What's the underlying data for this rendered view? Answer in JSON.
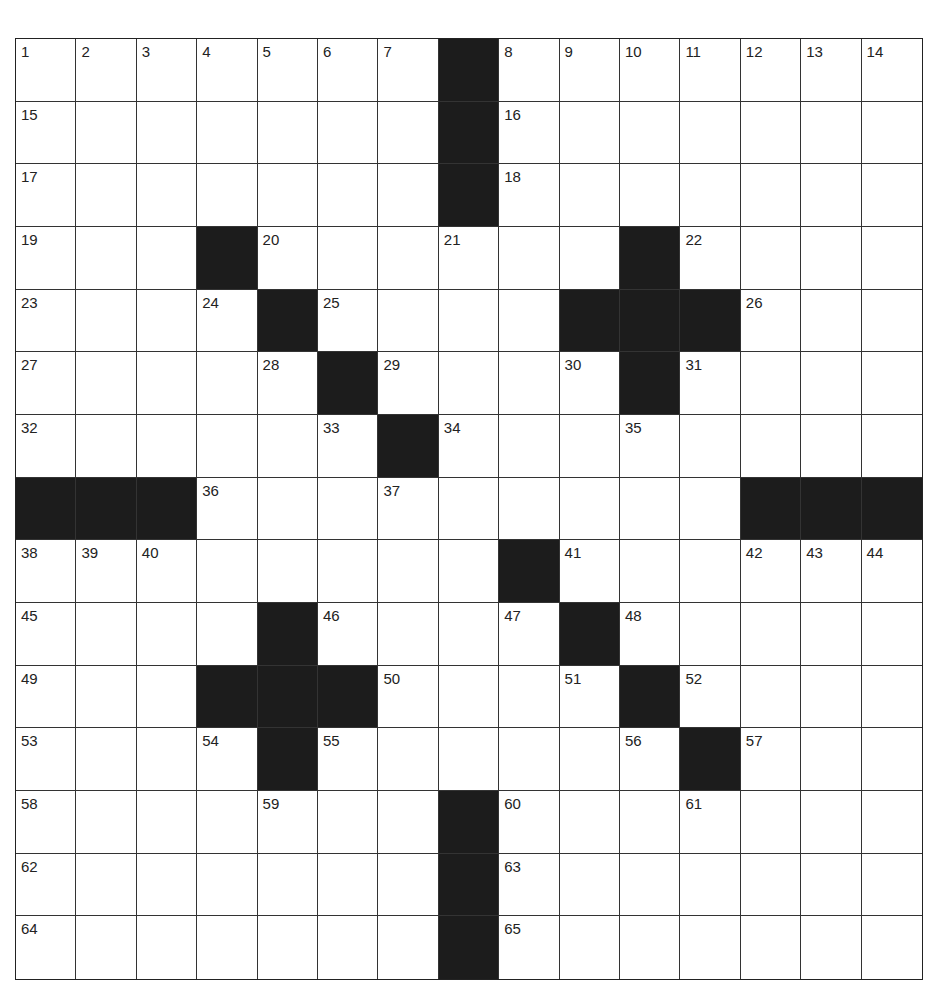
{
  "puzzle": {
    "rows": 15,
    "cols": 15,
    "colors": {
      "block": "#1c1c1c",
      "cell": "#ffffff",
      "line": "#333333"
    },
    "grid": [
      [
        "1",
        "2",
        "3",
        "4",
        "5",
        "6",
        "7",
        "#",
        "8",
        "9",
        "10",
        "11",
        "12",
        "13",
        "14"
      ],
      [
        "15",
        "",
        "",
        "",
        "",
        "",
        "",
        "#",
        "16",
        "",
        "",
        "",
        "",
        "",
        ""
      ],
      [
        "17",
        "",
        "",
        "",
        "",
        "",
        "",
        "#",
        "18",
        "",
        "",
        "",
        "",
        "",
        ""
      ],
      [
        "19",
        "",
        "",
        "#",
        "20",
        "",
        "",
        "21",
        "",
        "",
        "#",
        "22",
        "",
        "",
        ""
      ],
      [
        "23",
        "",
        "",
        "24",
        "#",
        "25",
        "",
        "",
        "",
        "#",
        "#",
        "#",
        "26",
        "",
        ""
      ],
      [
        "27",
        "",
        "",
        "",
        "28",
        "#",
        "29",
        "",
        "",
        "30",
        "#",
        "31",
        "",
        "",
        ""
      ],
      [
        "32",
        "",
        "",
        "",
        "",
        "33",
        "#",
        "34",
        "",
        "",
        "35",
        "",
        "",
        "",
        ""
      ],
      [
        "#",
        "#",
        "#",
        "36",
        "",
        "",
        "37",
        "",
        "",
        "",
        "",
        "",
        "#",
        "#",
        "#"
      ],
      [
        "38",
        "39",
        "40",
        "",
        "",
        "",
        "",
        "",
        "#",
        "41",
        "",
        "",
        "42",
        "43",
        "44"
      ],
      [
        "45",
        "",
        "",
        "",
        "#",
        "46",
        "",
        "",
        "47",
        "#",
        "48",
        "",
        "",
        "",
        ""
      ],
      [
        "49",
        "",
        "",
        "#",
        "#",
        "#",
        "50",
        "",
        "",
        "51",
        "#",
        "52",
        "",
        "",
        ""
      ],
      [
        "53",
        "",
        "",
        "54",
        "#",
        "55",
        "",
        "",
        "",
        "",
        "56",
        "#",
        "57",
        "",
        ""
      ],
      [
        "58",
        "",
        "",
        "",
        "59",
        "",
        "",
        "#",
        "60",
        "",
        "",
        "61",
        "",
        "",
        ""
      ],
      [
        "62",
        "",
        "",
        "",
        "",
        "",
        "",
        "#",
        "63",
        "",
        "",
        "",
        "",
        "",
        ""
      ],
      [
        "64",
        "",
        "",
        "",
        "",
        "",
        "",
        "#",
        "65",
        "",
        "",
        "",
        "",
        "",
        ""
      ]
    ]
  }
}
